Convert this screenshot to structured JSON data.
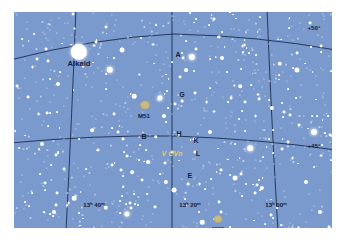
{
  "chart_meta": {
    "title": "Star chart field around V CVn (Canes Venatici / Ursa Major border)",
    "background_color": "#7a99cc",
    "star_color": "#ffffff",
    "grid_color": "#1c2f52",
    "label_color": "#14213d",
    "variable_label_color": "#e8c46a",
    "dso_color": "#d8c88a"
  },
  "chart_data": {
    "type": "scatter",
    "xlabel": "Right Ascension",
    "ylabel": "Declination",
    "grid": true,
    "legend_position": "none",
    "ra_ticks": [
      "13h 40m",
      "13h 20m",
      "13h 00m"
    ],
    "dec_ticks": [
      "+50°",
      "+45°"
    ],
    "ra_range_hours": [
      12.83,
      13.83
    ],
    "dec_range_deg": [
      42.5,
      51.5
    ],
    "labeled_objects": [
      {
        "label": "Alkaid",
        "type": "star",
        "magnitude": 1.9,
        "x_px": 65,
        "y_px": 40
      },
      {
        "label": "A",
        "type": "comparison-star",
        "magnitude": 5.2,
        "x_px": 178,
        "y_px": 45
      },
      {
        "label": "G",
        "type": "comparison-star",
        "magnitude": 6.7,
        "x_px": 168,
        "y_px": 89
      },
      {
        "label": "B",
        "type": "comparison-star",
        "magnitude": 6.1,
        "x_px": 142,
        "y_px": 125
      },
      {
        "label": "H",
        "type": "comparison-star",
        "magnitude": 6.9,
        "x_px": 164,
        "y_px": 123
      },
      {
        "label": "K",
        "type": "comparison-star",
        "magnitude": 7.2,
        "x_px": 180,
        "y_px": 127
      },
      {
        "label": "L",
        "type": "comparison-star",
        "magnitude": 7.5,
        "x_px": 181,
        "y_px": 140
      },
      {
        "label": "E",
        "type": "comparison-star",
        "magnitude": 6.4,
        "x_px": 174,
        "y_px": 172
      },
      {
        "label": "V CVn",
        "type": "variable-star",
        "magnitude": 6.5,
        "x_px": 158,
        "y_px": 140
      },
      {
        "label": "M51",
        "type": "galaxy",
        "magnitude": 8.4,
        "x_px": 131,
        "y_px": 99
      },
      {
        "label": "M63",
        "type": "galaxy",
        "magnitude": 8.6,
        "x_px": 204,
        "y_px": 213
      }
    ]
  },
  "labels": {
    "alkaid": "Alkaid",
    "a": "A",
    "g": "G",
    "b": "B",
    "h": "H",
    "k": "K",
    "l": "L",
    "e": "E",
    "v_cvn": "V CVn",
    "m51": "M51",
    "m63": "M63"
  },
  "coordinates": {
    "ra_1": "13ʰ 40ᵐ",
    "ra_2": "13ʰ 20ᵐ",
    "ra_3": "13ʰ 00ᵐ",
    "dec_1": "+50°",
    "dec_2": "+45°"
  }
}
